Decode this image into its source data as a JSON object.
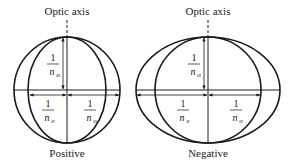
{
  "diagrams": [
    {
      "id": "positive",
      "axis_label": "Optic axis",
      "caption": "Positive",
      "vertical_label": {
        "num": "1",
        "den": "n",
        "sub": "o"
      },
      "left_label": {
        "num": "1",
        "den": "n",
        "sub": "e"
      },
      "right_label": {
        "num": "1",
        "den": "n",
        "sub": "o"
      }
    },
    {
      "id": "negative",
      "axis_label": "Optic axis",
      "caption": "Negative",
      "vertical_label": {
        "num": "1",
        "den": "n",
        "sub": "o"
      },
      "left_label": {
        "num": "1",
        "den": "n",
        "sub": "e"
      },
      "right_label": {
        "num": "1",
        "den": "n",
        "sub": "o"
      }
    }
  ],
  "colors": {
    "stroke": "#1a1a1a",
    "background": "#ffffff"
  }
}
